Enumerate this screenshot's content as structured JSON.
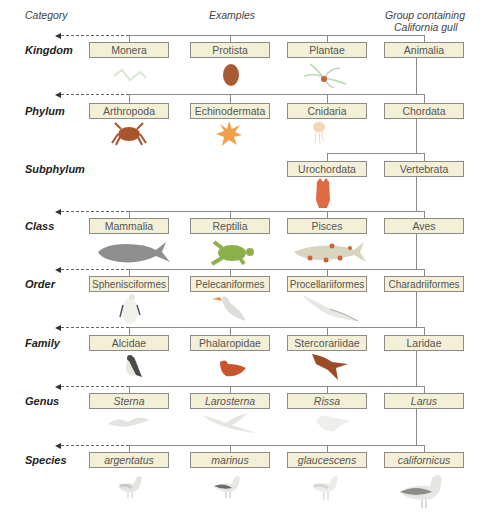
{
  "headers": {
    "category": "Category",
    "examples": "Examples",
    "group_line1": "Group containing",
    "group_line2": "California gull"
  },
  "colors": {
    "box_fill": "#f4f0d8",
    "box_border": "#8c8c84",
    "connector": "#8c8c84",
    "text": "#555555"
  },
  "rows": [
    {
      "category": "Kingdom",
      "boxes": [
        "Monera",
        "Protista",
        "Plantae",
        "Animalia"
      ],
      "italic": false,
      "illustrations": [
        "bacteria-icon",
        "amoeba-icon",
        "plant-icon",
        ""
      ]
    },
    {
      "category": "Phylum",
      "boxes": [
        "Arthropoda",
        "Echinodermata",
        "Cnidaria",
        "Chordata"
      ],
      "italic": false,
      "illustrations": [
        "crab-icon",
        "starfish-icon",
        "jellyfish-icon",
        ""
      ]
    },
    {
      "category": "Subphylum",
      "boxes": [
        "",
        "",
        "Urochordata",
        "Vertebrata"
      ],
      "italic": false,
      "illustrations": [
        "",
        "",
        "sea-squirt-icon",
        ""
      ]
    },
    {
      "category": "Class",
      "boxes": [
        "Mammalia",
        "Reptilia",
        "Pisces",
        "Aves"
      ],
      "italic": false,
      "illustrations": [
        "whale-icon",
        "turtle-icon",
        "fish-icon",
        ""
      ]
    },
    {
      "category": "Order",
      "boxes": [
        "Sphenisciformes",
        "Pelecaniformes",
        "Procellariiformes",
        "Charadriiformes"
      ],
      "italic": false,
      "illustrations": [
        "penguin-icon",
        "pelican-icon",
        "albatross-icon",
        ""
      ]
    },
    {
      "category": "Family",
      "boxes": [
        "Alcidae",
        "Phalaropidae",
        "Stercorariidae",
        "Laridae"
      ],
      "italic": false,
      "illustrations": [
        "puffin-icon",
        "phalarope-icon",
        "skua-icon",
        ""
      ]
    },
    {
      "category": "Genus",
      "boxes": [
        "Sterna",
        "Larosterna",
        "Rissa",
        "Larus"
      ],
      "italic": true,
      "illustrations": [
        "tern-icon",
        "inca-tern-icon",
        "kittiwake-icon",
        ""
      ]
    },
    {
      "category": "Species",
      "boxes": [
        "argentatus",
        "marinus",
        "glaucescens",
        "californicus"
      ],
      "italic": true,
      "illustrations": [
        "herring-gull-icon",
        "black-backed-gull-icon",
        "glaucous-winged-gull-icon",
        "california-gull-icon"
      ]
    }
  ]
}
